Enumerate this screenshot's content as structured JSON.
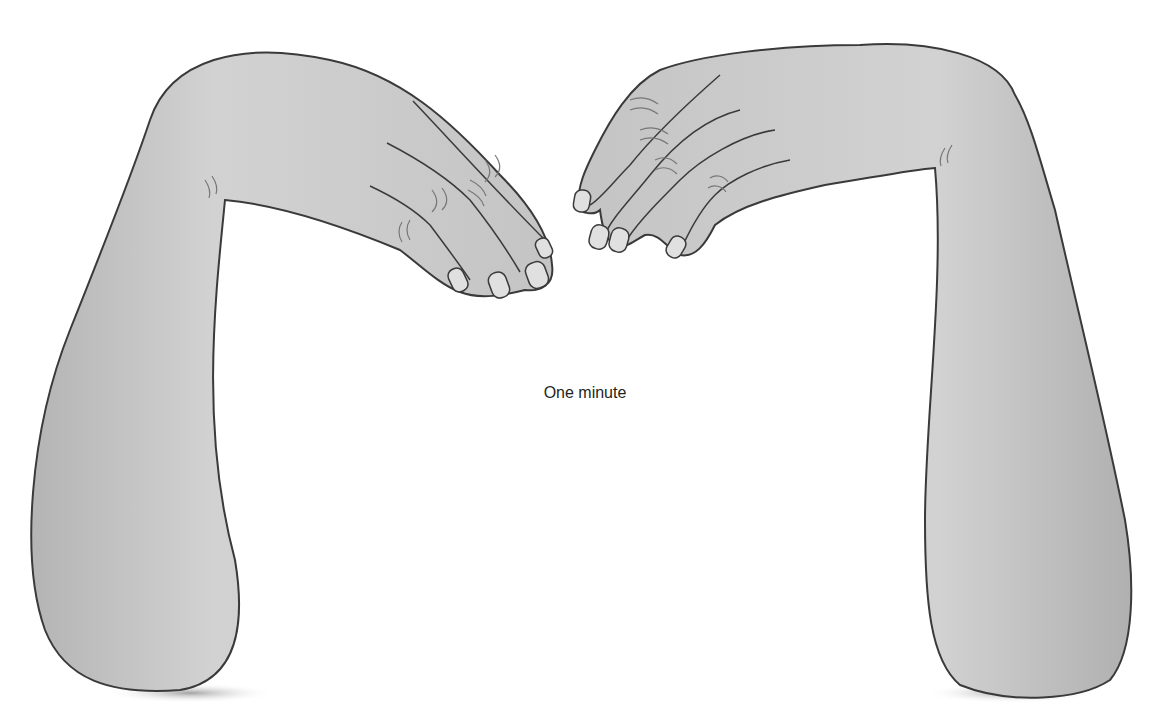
{
  "figure": {
    "caption": "One minute",
    "colors": {
      "skin_fill": "#c9c9c9",
      "skin_highlight": "#dcdcdc",
      "outline": "#3a3a3a",
      "shadow": "#8c8c8c",
      "background": "#ffffff"
    }
  }
}
